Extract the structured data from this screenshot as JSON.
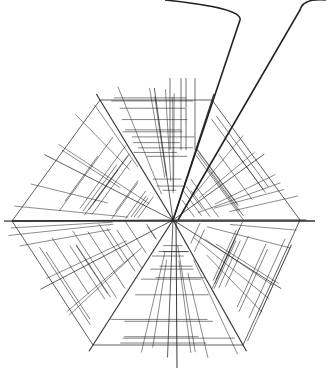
{
  "image": {
    "description": "Pen line drawing of a hexagonal spider web with a long thread rising to the top edge",
    "stroke_color": "#222222",
    "background": "#ffffff",
    "center": [
      173,
      220
    ],
    "hexagon": [
      [
        100,
        100
      ],
      [
        212,
        100
      ],
      [
        300,
        220
      ],
      [
        243,
        345
      ],
      [
        93,
        345
      ],
      [
        12,
        221
      ]
    ],
    "threads": [
      {
        "from": [
          173,
          220
        ],
        "to": [
          240,
          20
        ],
        "curve_to": [
          165,
          0
        ]
      },
      {
        "from": [
          178,
          220
        ],
        "to": [
          300,
          10
        ],
        "curve_to": [
          326,
          0
        ]
      }
    ]
  }
}
